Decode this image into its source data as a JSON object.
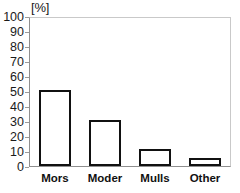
{
  "chart_data": {
    "type": "bar",
    "title": "",
    "subtitle": "",
    "xlabel": "",
    "ylabel": "",
    "unit_label": "[%]",
    "categories": [
      "Mors",
      "Moder",
      "Mulls",
      "Other"
    ],
    "values": [
      51,
      31,
      11.5,
      5.5
    ],
    "series": [
      {
        "name": "",
        "values": [
          51,
          31,
          11.5,
          5.5
        ]
      }
    ],
    "ylim": [
      0,
      100
    ],
    "ytick_step": 10,
    "yticks": [
      0,
      10,
      20,
      30,
      40,
      50,
      60,
      70,
      80,
      90,
      100
    ],
    "ytick_labels": [
      "0",
      "10",
      "20",
      "30",
      "40",
      "50",
      "60",
      "70",
      "80",
      "90",
      "100"
    ],
    "grid": false,
    "legend": false,
    "legend_position": "none",
    "bar_fill_color": "#ffffff",
    "bar_edge_color": "#111111",
    "axis_color": "#8f8f8f",
    "frame_color": "#c9c9c9",
    "text_color": "#1a1a1a",
    "background_color": "#ffffff"
  }
}
